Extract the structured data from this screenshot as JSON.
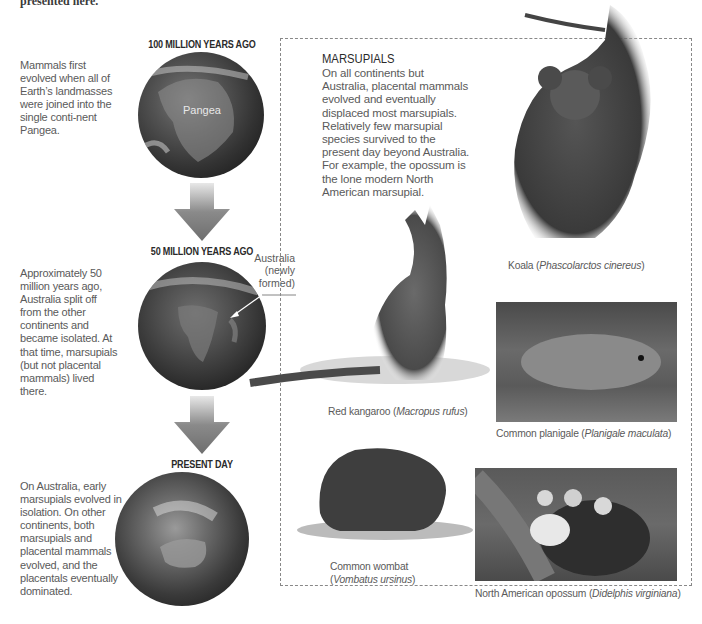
{
  "cut_off_header": "presented here.",
  "timeline": {
    "eras": [
      {
        "title": "100 MILLION YEARS AGO",
        "description": "Mammals first evolved when all of Earth’s landmasses were joined into the single conti-nent Pangea.",
        "globe_label": "Pangea"
      },
      {
        "title": "50 MILLION YEARS AGO",
        "description": "Approximately 50 million years ago, Australia split off from the other continents and became isolated. At that time, marsupials (but not placental mammals) lived there.",
        "callout_line1": "Australia",
        "callout_line2": "(newly",
        "callout_line3": "formed)"
      },
      {
        "title": "PRESENT DAY",
        "description": "On Australia, early marsupials evolved in isolation. On other continents, both marsupials and placental mammals evolved, and the placentals eventually dominated."
      }
    ]
  },
  "marsupials": {
    "title": "MARSUPIALS",
    "body": "On all continents but Australia, placental mammals evolved and eventually displaced most marsupials. Relatively few marsupial species survived to the present day beyond Australia. For example, the opossum is the lone modern North American marsupial.",
    "animals": [
      {
        "common": "Koala",
        "scientific": "Phascolarctos cinereus"
      },
      {
        "common": "Red kangaroo",
        "scientific": "Macropus rufus"
      },
      {
        "common": "Common planigale",
        "scientific": "Planigale maculata"
      },
      {
        "common": "Common wombat",
        "scientific": "Vombatus ursinus"
      },
      {
        "common": "North American opossum",
        "scientific": "Didelphis virginiana"
      }
    ]
  }
}
